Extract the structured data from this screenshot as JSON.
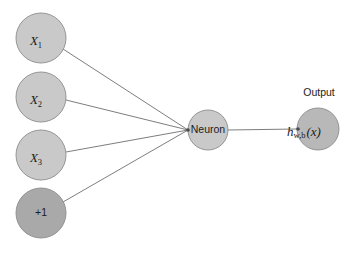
{
  "diagram": {
    "title_text": "",
    "background_color": "#ffffff",
    "nodes": [
      {
        "id": "input-x1",
        "name": "input-node-x1",
        "main_text": "X",
        "sub_text": "1",
        "style": "input",
        "cx": 41,
        "cy": 38,
        "r": 25,
        "fill": "#c9c9c9",
        "stroke": "#8c8c8c"
      },
      {
        "id": "input-x2",
        "name": "input-node-x2",
        "main_text": "X",
        "sub_text": "2",
        "style": "input",
        "cx": 41,
        "cy": 97,
        "r": 25,
        "fill": "#c9c9c9",
        "stroke": "#8c8c8c"
      },
      {
        "id": "input-x3",
        "name": "input-node-x3",
        "main_text": "X",
        "sub_text": "3",
        "style": "input",
        "cx": 41,
        "cy": 155,
        "r": 25,
        "fill": "#c9c9c9",
        "stroke": "#8c8c8c"
      },
      {
        "id": "bias",
        "name": "bias-node",
        "main_text": "+1",
        "sub_text": "",
        "style": "bias",
        "cx": 41,
        "cy": 213,
        "r": 25,
        "fill": "#a9a9a9",
        "stroke": "#8c8c8c"
      },
      {
        "id": "neuron",
        "name": "neuron-node",
        "main_text": "Neuron",
        "sub_text": "",
        "style": "neuron",
        "cx": 208,
        "cy": 130,
        "r": 20,
        "fill": "#c9c9c9",
        "stroke": "#8c8c8c"
      },
      {
        "id": "output",
        "name": "output-node",
        "main_text": "h",
        "sub_text": "w,b",
        "tail_text": "(x)",
        "style": "output",
        "cx": 318,
        "cy": 129,
        "r": 21,
        "fill": "#b8b8b8",
        "stroke": "#8c8c8c"
      }
    ],
    "edges": [
      {
        "name": "edge-x1-to-neuron",
        "from": "input-x1",
        "to": "neuron",
        "x1": 63,
        "y1": 49,
        "x2": 188,
        "y2": 130
      },
      {
        "name": "edge-x2-to-neuron",
        "from": "input-x2",
        "to": "neuron",
        "x1": 66,
        "y1": 100,
        "x2": 188,
        "y2": 130
      },
      {
        "name": "edge-x3-to-neuron",
        "from": "input-x3",
        "to": "neuron",
        "x1": 66,
        "y1": 152,
        "x2": 188,
        "y2": 130
      },
      {
        "name": "edge-bias-to-neuron",
        "from": "bias",
        "to": "neuron",
        "x1": 63,
        "y1": 202,
        "x2": 188,
        "y2": 130
      },
      {
        "name": "edge-neuron-to-output",
        "from": "neuron",
        "to": "output",
        "x1": 228,
        "y1": 130,
        "x2": 297,
        "y2": 129
      }
    ],
    "junctions": [
      {
        "name": "neuron-input-junction-dot",
        "cx": 188,
        "cy": 130,
        "r": 1.8
      },
      {
        "name": "output-input-junction-dot",
        "cx": 298,
        "cy": 129,
        "r": 1.8
      }
    ],
    "captions": [
      {
        "name": "output-caption",
        "text": "Output",
        "x": 319,
        "y": 96
      }
    ]
  }
}
